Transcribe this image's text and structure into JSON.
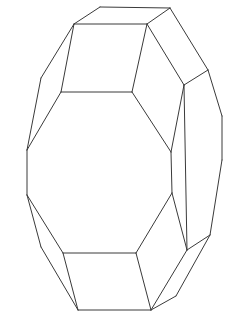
{
  "figure": {
    "stroke_color": "#3a3a3a",
    "background": "#ffffff",
    "vertices": {
      "A": [
        100,
        7
      ],
      "B": [
        170,
        8
      ],
      "C": [
        74,
        24
      ],
      "D": [
        147,
        24
      ],
      "E": [
        208,
        70
      ],
      "F": [
        184,
        85
      ],
      "G": [
        222,
        116
      ],
      "H": [
        41,
        78
      ],
      "I": [
        61,
        92
      ],
      "J": [
        132,
        92
      ],
      "K": [
        27,
        150
      ],
      "L": [
        171,
        152
      ],
      "M": [
        222,
        160
      ],
      "N": [
        27,
        195
      ],
      "O": [
        172,
        193
      ],
      "P": [
        41,
        247
      ],
      "Q": [
        63,
        253
      ],
      "R": [
        136,
        253
      ],
      "S": [
        210,
        235
      ],
      "T": [
        187,
        250
      ],
      "U": [
        78,
        310
      ],
      "V": [
        151,
        310
      ],
      "W": [
        176,
        296
      ]
    },
    "edges": [
      [
        "A",
        "B"
      ],
      [
        "A",
        "C"
      ],
      [
        "B",
        "D"
      ],
      [
        "C",
        "D"
      ],
      [
        "B",
        "E"
      ],
      [
        "D",
        "F"
      ],
      [
        "E",
        "F"
      ],
      [
        "E",
        "G"
      ],
      [
        "C",
        "H"
      ],
      [
        "C",
        "I"
      ],
      [
        "I",
        "J"
      ],
      [
        "D",
        "J"
      ],
      [
        "H",
        "K"
      ],
      [
        "I",
        "K"
      ],
      [
        "J",
        "L"
      ],
      [
        "F",
        "L"
      ],
      [
        "G",
        "M"
      ],
      [
        "K",
        "N"
      ],
      [
        "L",
        "O"
      ],
      [
        "M",
        "S"
      ],
      [
        "F",
        "T"
      ],
      [
        "O",
        "T"
      ],
      [
        "T",
        "S"
      ],
      [
        "N",
        "P"
      ],
      [
        "N",
        "Q"
      ],
      [
        "Q",
        "R"
      ],
      [
        "O",
        "R"
      ],
      [
        "P",
        "U"
      ],
      [
        "Q",
        "U"
      ],
      [
        "R",
        "V"
      ],
      [
        "U",
        "V"
      ],
      [
        "T",
        "V"
      ],
      [
        "S",
        "W"
      ],
      [
        "W",
        "V"
      ]
    ]
  }
}
